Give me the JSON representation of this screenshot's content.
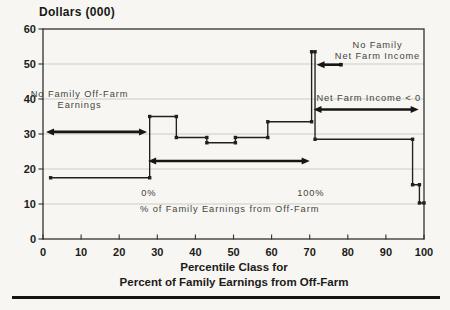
{
  "figure": {
    "title": "Dollars (000)"
  },
  "chart_data": {
    "type": "line",
    "subtype": "step",
    "title": "Dollars (000)",
    "xlabel_lines": [
      "Percentile Class for",
      "Percent of Family Earnings from Off-Farm"
    ],
    "ylabel": "Dollars (000)",
    "xlim": [
      0,
      100
    ],
    "ylim": [
      0,
      60
    ],
    "xticks": [
      0,
      10,
      20,
      30,
      40,
      50,
      60,
      70,
      80,
      90,
      100
    ],
    "yticks": [
      0,
      10,
      20,
      30,
      40,
      50,
      60
    ],
    "grid": "horizontal",
    "legend": "none",
    "series": [
      {
        "name": "household-income-by-percentile-step",
        "points": [
          [
            2,
            17.5
          ],
          [
            28,
            17.5
          ],
          [
            28,
            35
          ],
          [
            35,
            35
          ],
          [
            35,
            29
          ],
          [
            43,
            29
          ],
          [
            43,
            27.5
          ],
          [
            50.5,
            27.5
          ],
          [
            50.5,
            29
          ],
          [
            59,
            29
          ],
          [
            59,
            33.5
          ],
          [
            70.5,
            33.5
          ],
          [
            70.5,
            53.5
          ],
          [
            71.4,
            53.5
          ],
          [
            71.4,
            28.5
          ],
          [
            97,
            28.5
          ],
          [
            97,
            15.5
          ],
          [
            98.8,
            15.5
          ],
          [
            98.8,
            10.3
          ],
          [
            100,
            10.3
          ]
        ]
      }
    ],
    "range_arrows": [
      {
        "name": "no-off-farm-earnings-range",
        "x1": 0.8,
        "x2": 27.3,
        "y": 30.6,
        "heads": "both"
      },
      {
        "name": "off-farm-0-to-100-range",
        "x1": 27.6,
        "x2": 70.0,
        "y": 22.3,
        "heads": "both"
      },
      {
        "name": "net-farm-income-negative-range",
        "x1": 71.0,
        "x2": 98.6,
        "y": 37.0,
        "heads": "both"
      },
      {
        "name": "no-net-farm-income-pointer",
        "x1": 71.8,
        "x2": 78.2,
        "y": 49.8,
        "heads": "left"
      }
    ],
    "annotations": [
      {
        "name": "no-family-off-farm-earnings-label",
        "lines": [
          "No Family Off-Farm",
          "Earnings"
        ],
        "x": 9.6,
        "y": [
          40.6,
          37.3
        ]
      },
      {
        "name": "no-family-net-farm-income-label",
        "lines": [
          "No Family",
          "Net Farm Income"
        ],
        "x": 87.8,
        "y": [
          54.6,
          51.4
        ]
      },
      {
        "name": "net-farm-income-lt-0-label",
        "lines": [
          "Net Farm Income < 0"
        ],
        "x": 85.5,
        "y": [
          39.5
        ]
      },
      {
        "name": "zero-percent-label",
        "lines": [
          "0%"
        ],
        "x": 27.8,
        "y": [
          12.2
        ]
      },
      {
        "name": "hundred-percent-label",
        "lines": [
          "100%"
        ],
        "x": 70.3,
        "y": [
          12.2
        ]
      },
      {
        "name": "percent-off-farm-note",
        "lines": [
          "% of Family Earnings from Off-Farm"
        ],
        "x": 49.0,
        "y": [
          7.8
        ]
      }
    ],
    "colors": {
      "line": "#20201e",
      "arrow": "#161614",
      "grid": "#c9c7c0",
      "border": "#33322f",
      "annotation_text": "#45443f",
      "tick_text": "#1c1b19",
      "background": "#f7f6f2",
      "rule": "#141412"
    }
  }
}
